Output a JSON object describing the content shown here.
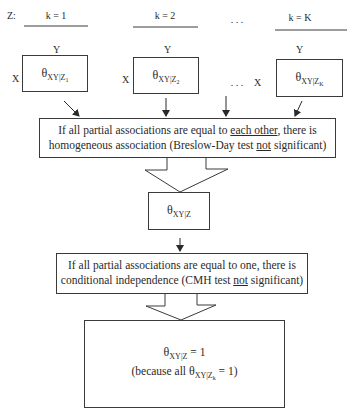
{
  "z_label": "Z:",
  "strata": [
    {
      "header": "k = 1",
      "row": "X",
      "col": "Y",
      "theta": "θ",
      "sub": "XY|Z",
      "subsub": "1"
    },
    {
      "header": "k = 2",
      "row": "X",
      "col": "Y",
      "theta": "θ",
      "sub": "XY|Z",
      "subsub": "2"
    },
    {
      "header": "k = K",
      "row": "X",
      "col": "Y",
      "theta": "θ",
      "sub": "XY|Z",
      "subsub": "K"
    }
  ],
  "ellipsis_header": ". . .",
  "ellipsis_middle": ". . .",
  "homogeneous_box": {
    "line1_pre": "If all partial associations are equal to ",
    "line1_underlined": "each other",
    "line1_post": ", there is",
    "line2_pre": "homogeneous association (Breslow-Day test ",
    "line2_underlined": "not",
    "line2_post": " significant)"
  },
  "common_theta_box": {
    "theta": "θ",
    "sub": "XY|Z"
  },
  "independence_box": {
    "line1": "If all partial associations are equal to one, there is",
    "line2_pre": "conditional independence (CMH test ",
    "line2_underlined": "not",
    "line2_post": " significant)"
  },
  "result_box": {
    "line1_theta": "θ",
    "line1_sub": "XY|Z",
    "line1_post": " = 1",
    "line2_pre": "(because all ",
    "line2_theta": "θ",
    "line2_sub": "XY|Z",
    "line2_subsub": "k",
    "line2_post": " = 1)"
  },
  "colors": {
    "line": "#3a3a3a",
    "text": "#2a2a2a",
    "background": "#ffffff"
  }
}
